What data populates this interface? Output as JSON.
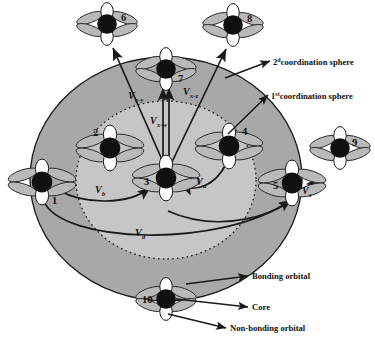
{
  "figure": {
    "background": "#ffffff"
  },
  "colors": {
    "outer_sphere": "#a8a8a8",
    "inner_sphere": "#c6c6c6",
    "core": "#101010",
    "nonbonding_orbital": "#ffffff",
    "bonding_orbital": "#b9b9b9",
    "stroke": "#1a1a1a"
  },
  "spheres": [
    {
      "id": "outer",
      "label": "2dcoordination sphere",
      "label_main": "2",
      "label_sup": "d",
      "label_rest": "coordination sphere",
      "style": "solid"
    },
    {
      "id": "inner",
      "label": "1stcoordination sphere",
      "label_main": "1",
      "label_sup": "st",
      "label_rest": "coordination sphere",
      "style": "dotted"
    }
  ],
  "nodes": [
    {
      "id": 1,
      "label": "1",
      "x": 42,
      "y": 182,
      "label_dx": 10,
      "label_dy": 22,
      "shell": "first"
    },
    {
      "id": 2,
      "label": "2",
      "x": 110,
      "y": 148,
      "label_dx": -17,
      "label_dy": -12,
      "shell": "first"
    },
    {
      "id": 3,
      "label": "3",
      "x": 166,
      "y": 178,
      "label_dx": -22,
      "label_dy": 7,
      "shell": "center"
    },
    {
      "id": 4,
      "label": "4",
      "x": 229,
      "y": 146,
      "label_dx": 13,
      "label_dy": -11,
      "shell": "first"
    },
    {
      "id": 5,
      "label": "5",
      "x": 292,
      "y": 183,
      "label_dx": -19,
      "label_dy": 6,
      "shell": "first"
    },
    {
      "id": 6,
      "label": "6",
      "x": 107,
      "y": 24,
      "label_dx": 14,
      "label_dy": -3,
      "shell": "second"
    },
    {
      "id": 7,
      "label": "7",
      "x": 166,
      "y": 69,
      "label_dx": 12,
      "label_dy": 13,
      "shell": "second"
    },
    {
      "id": 8,
      "label": "8",
      "x": 233,
      "y": 25,
      "label_dx": 14,
      "label_dy": -3,
      "shell": "second"
    },
    {
      "id": 9,
      "label": "9",
      "x": 340,
      "y": 148,
      "label_dx": 12,
      "label_dy": -2,
      "shell": "second"
    },
    {
      "id": 10,
      "label": "10",
      "x": 166,
      "y": 299,
      "label_dx": -24,
      "label_dy": 4,
      "shell": "second"
    }
  ],
  "couplings": [
    {
      "id": "v_b",
      "main": "V",
      "sub": "b",
      "x": 95,
      "y": 189,
      "note": "node1 to node3 arc"
    },
    {
      "id": "v_a",
      "main": "V",
      "sub": "a",
      "x": 196,
      "y": 181,
      "note": "node4 to node3 arc"
    },
    {
      "id": "v_c",
      "main": "V",
      "sub": "c",
      "x": 302,
      "y": 190,
      "note": "node5 to node9 arc"
    },
    {
      "id": "v_d",
      "main": "V",
      "sub": "d",
      "x": 135,
      "y": 232,
      "note": "long lower arc"
    },
    {
      "id": "v_xy",
      "main": "V",
      "sub": "x-y",
      "x": 130,
      "y": 95,
      "note": "node3 to node6"
    },
    {
      "id": "v_xw",
      "main": "V",
      "sub": "x-w",
      "x": 152,
      "y": 120,
      "note": "node3 to node7"
    },
    {
      "id": "v_xz",
      "main": "V",
      "sub": "x-z",
      "x": 185,
      "y": 91,
      "note": "node3 to node8"
    }
  ],
  "legend": [
    {
      "id": "bonding",
      "text": "Bonding orbital",
      "x": 251,
      "y": 278
    },
    {
      "id": "core",
      "text": "Core",
      "x": 251,
      "y": 310
    },
    {
      "id": "nonbonding",
      "text": "Non-bonding orbital",
      "x": 229,
      "y": 330
    }
  ],
  "annotations": {
    "second_sphere_label_x": 274,
    "second_sphere_label_y": 63,
    "first_sphere_label_x": 272,
    "first_sphere_label_y": 97
  }
}
